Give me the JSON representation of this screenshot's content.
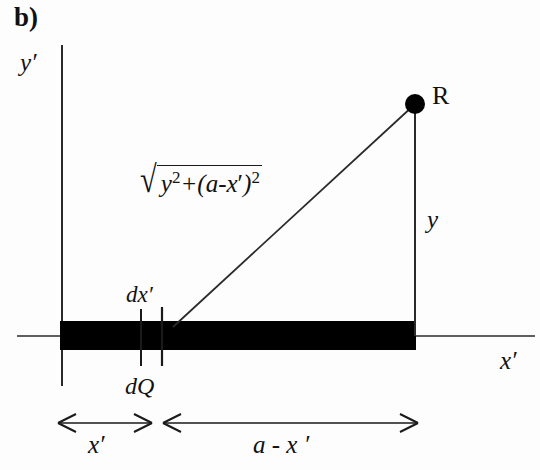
{
  "figure": {
    "panel_letter": "b)",
    "axes": {
      "y_label": "y′",
      "x_label": "x′"
    },
    "point": {
      "label": "R"
    },
    "labels": {
      "height": "y",
      "element_width": "dx′",
      "charge_element": "dQ"
    },
    "formula": {
      "radical": "√",
      "term1_base": "y",
      "term1_exp": "2",
      "operator": "+",
      "open_paren": "(",
      "term2": "a-x",
      "term2_prime": "′",
      "close_paren": ")",
      "term2_exp": "2",
      "plain_text": "√(y²+(a-x′)²)"
    },
    "dimensions": [
      {
        "name": "x-prime",
        "label": "x′"
      },
      {
        "name": "a-minus-x-prime",
        "label": "a - x ′"
      }
    ],
    "colors": {
      "ink": "#111111",
      "rod": "#000000",
      "background": "#fdfdfd",
      "line": "#2a2a2a"
    }
  }
}
